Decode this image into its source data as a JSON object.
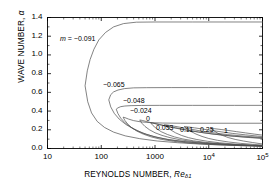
{
  "figure": {
    "background": "#ffffff",
    "axis_color": "#000000",
    "curve_color": "#4d4d4d"
  },
  "axes": {
    "y_title_main": "WAVE NUMBER,",
    "y_title_symbol": "α",
    "x_title_main": "REYNOLDS NUMBER,",
    "x_title_symbol": "Re",
    "x_title_subscript": "δ1",
    "y_ticks": [
      "0.0",
      "0.2",
      "0.4",
      "0.6",
      "0.8",
      "1.0",
      "1.2",
      "1.4"
    ],
    "x_ticks": [
      {
        "label": "10",
        "sup": ""
      },
      {
        "label": "100",
        "sup": ""
      },
      {
        "label": "1000",
        "sup": ""
      },
      {
        "label": "10",
        "sup": "4"
      },
      {
        "label": "10",
        "sup": "5"
      }
    ]
  },
  "contour_labels": [
    {
      "id": "m-label",
      "text": "m = −0.091",
      "x": 60,
      "y": 35,
      "italic_prefix": true
    },
    {
      "id": "label-m0065",
      "text": "−0.065",
      "x": 103,
      "y": 81,
      "italic_prefix": false
    },
    {
      "id": "label-m0048",
      "text": "−0.048",
      "x": 123,
      "y": 97,
      "italic_prefix": false
    },
    {
      "id": "label-m0024",
      "text": "−0.024",
      "x": 130,
      "y": 107,
      "italic_prefix": false
    },
    {
      "id": "label-0",
      "text": "0",
      "x": 146,
      "y": 115,
      "italic_prefix": false
    },
    {
      "id": "label-0053",
      "text": "0.053",
      "x": 156,
      "y": 124,
      "italic_prefix": false
    },
    {
      "id": "label-011",
      "text": "0.11",
      "x": 180,
      "y": 126,
      "italic_prefix": false
    },
    {
      "id": "label-025",
      "text": "0.25",
      "x": 200,
      "y": 126,
      "italic_prefix": false
    },
    {
      "id": "label-1",
      "text": "1",
      "x": 224,
      "y": 127,
      "italic_prefix": false
    }
  ],
  "chart_data": {
    "type": "line",
    "title": "",
    "xlabel": "REYNOLDS NUMBER, Re_δ1",
    "ylabel": "WAVE NUMBER, α",
    "xscale": "log",
    "yscale": "linear",
    "xlim": [
      10,
      100000
    ],
    "ylim": [
      0.0,
      1.4
    ],
    "xticks": [
      10,
      100,
      1000,
      10000,
      100000
    ],
    "yticks": [
      0.0,
      0.2,
      0.4,
      0.6,
      0.8,
      1.0,
      1.2,
      1.4
    ],
    "grid": false,
    "legend": "inline-contour-labels",
    "series": [
      {
        "name": "m = -0.091",
        "m": -0.091,
        "nose": {
          "Re": 50,
          "alpha": 0.67
        },
        "upper_asymptote": 1.35,
        "upper_branch": [
          [
            50,
            0.67
          ],
          [
            55,
            0.83
          ],
          [
            62,
            0.95
          ],
          [
            73,
            1.06
          ],
          [
            90,
            1.16
          ],
          [
            120,
            1.24
          ],
          [
            170,
            1.3
          ],
          [
            260,
            1.335
          ],
          [
            450,
            1.35
          ],
          [
            1000,
            1.352
          ],
          [
            5000,
            1.352
          ],
          [
            20000,
            1.352
          ],
          [
            100000,
            1.352
          ]
        ],
        "lower_branch": [
          [
            50,
            0.67
          ],
          [
            56,
            0.5
          ],
          [
            66,
            0.38
          ],
          [
            84,
            0.29
          ],
          [
            115,
            0.225
          ],
          [
            170,
            0.175
          ],
          [
            280,
            0.135
          ],
          [
            520,
            0.105
          ],
          [
            1100,
            0.08
          ],
          [
            2600,
            0.062
          ],
          [
            7000,
            0.047
          ],
          [
            20000,
            0.036
          ],
          [
            60000,
            0.028
          ],
          [
            100000,
            0.025
          ]
        ]
      },
      {
        "name": "m = -0.065",
        "m": -0.065,
        "nose": {
          "Re": 138,
          "alpha": 0.52
        },
        "upper_asymptote": 0.65,
        "upper_branch": [
          [
            138,
            0.52
          ],
          [
            150,
            0.575
          ],
          [
            170,
            0.605
          ],
          [
            205,
            0.625
          ],
          [
            270,
            0.64
          ],
          [
            400,
            0.648
          ],
          [
            700,
            0.65
          ],
          [
            2000,
            0.651
          ],
          [
            10000,
            0.651
          ],
          [
            100000,
            0.651
          ]
        ],
        "lower_branch": [
          [
            138,
            0.52
          ],
          [
            150,
            0.445
          ],
          [
            175,
            0.375
          ],
          [
            215,
            0.315
          ],
          [
            285,
            0.258
          ],
          [
            400,
            0.208
          ],
          [
            600,
            0.163
          ],
          [
            950,
            0.128
          ],
          [
            1700,
            0.098
          ],
          [
            3400,
            0.075
          ],
          [
            8000,
            0.056
          ],
          [
            22000,
            0.042
          ],
          [
            60000,
            0.033
          ],
          [
            100000,
            0.029
          ]
        ]
      },
      {
        "name": "m = -0.048",
        "m": -0.048,
        "nose": {
          "Re": 190,
          "alpha": 0.42
        },
        "upper_asymptote": 0.46,
        "upper_branch": [
          [
            190,
            0.42
          ],
          [
            205,
            0.435
          ],
          [
            230,
            0.447
          ],
          [
            275,
            0.454
          ],
          [
            360,
            0.458
          ],
          [
            560,
            0.46
          ],
          [
            1200,
            0.461
          ],
          [
            5000,
            0.461
          ],
          [
            30000,
            0.461
          ],
          [
            100000,
            0.461
          ]
        ],
        "lower_branch": [
          [
            190,
            0.42
          ],
          [
            205,
            0.372
          ],
          [
            230,
            0.325
          ],
          [
            275,
            0.276
          ],
          [
            350,
            0.23
          ],
          [
            480,
            0.188
          ],
          [
            700,
            0.15
          ],
          [
            1100,
            0.118
          ],
          [
            1900,
            0.091
          ],
          [
            3700,
            0.07
          ],
          [
            8500,
            0.053
          ],
          [
            24000,
            0.04
          ],
          [
            65000,
            0.031
          ],
          [
            100000,
            0.028
          ]
        ]
      },
      {
        "name": "m = -0.024",
        "m": -0.024,
        "nose": {
          "Re": 255,
          "alpha": 0.335
        },
        "upper_asymptote": 0.27,
        "upper_branch": [
          [
            255,
            0.335
          ],
          [
            275,
            0.33
          ],
          [
            320,
            0.315
          ],
          [
            400,
            0.298
          ],
          [
            540,
            0.285
          ],
          [
            800,
            0.277
          ],
          [
            1400,
            0.272
          ],
          [
            3000,
            0.27
          ],
          [
            12000,
            0.27
          ],
          [
            100000,
            0.27
          ]
        ],
        "lower_branch": [
          [
            255,
            0.335
          ],
          [
            275,
            0.3
          ],
          [
            310,
            0.262
          ],
          [
            370,
            0.222
          ],
          [
            460,
            0.186
          ],
          [
            610,
            0.153
          ],
          [
            850,
            0.124
          ],
          [
            1300,
            0.098
          ],
          [
            2200,
            0.077
          ],
          [
            4200,
            0.059
          ],
          [
            9500,
            0.045
          ],
          [
            26000,
            0.034
          ],
          [
            70000,
            0.026
          ],
          [
            100000,
            0.023
          ]
        ]
      },
      {
        "name": "m = 0",
        "m": 0,
        "nose": {
          "Re": 520,
          "alpha": 0.305
        },
        "upper_asymptote": 0.17,
        "upper_branch": [
          [
            520,
            0.305
          ],
          [
            580,
            0.3
          ],
          [
            700,
            0.288
          ],
          [
            900,
            0.272
          ],
          [
            1300,
            0.25
          ],
          [
            2000,
            0.226
          ],
          [
            3500,
            0.2
          ],
          [
            6500,
            0.175
          ],
          [
            13000,
            0.152
          ],
          [
            30000,
            0.13
          ],
          [
            60000,
            0.116
          ],
          [
            100000,
            0.108
          ]
        ],
        "lower_branch": [
          [
            520,
            0.305
          ],
          [
            570,
            0.27
          ],
          [
            650,
            0.236
          ],
          [
            790,
            0.2
          ],
          [
            1000,
            0.168
          ],
          [
            1350,
            0.14
          ],
          [
            1900,
            0.116
          ],
          [
            2900,
            0.094
          ],
          [
            4800,
            0.075
          ],
          [
            9000,
            0.059
          ],
          [
            20000,
            0.045
          ],
          [
            45000,
            0.035
          ],
          [
            100000,
            0.027
          ]
        ]
      },
      {
        "name": "0.053",
        "m": 0.053,
        "nose": {
          "Re": 830,
          "alpha": 0.275
        },
        "upper_asymptote": 0.155,
        "upper_branch": [
          [
            830,
            0.275
          ],
          [
            950,
            0.27
          ],
          [
            1200,
            0.258
          ],
          [
            1600,
            0.242
          ],
          [
            2400,
            0.222
          ],
          [
            3800,
            0.199
          ],
          [
            6500,
            0.176
          ],
          [
            12000,
            0.154
          ],
          [
            25000,
            0.135
          ],
          [
            55000,
            0.12
          ],
          [
            100000,
            0.111
          ]
        ],
        "lower_branch": [
          [
            830,
            0.275
          ],
          [
            920,
            0.244
          ],
          [
            1070,
            0.212
          ],
          [
            1300,
            0.18
          ],
          [
            1700,
            0.15
          ],
          [
            2300,
            0.124
          ],
          [
            3300,
            0.102
          ],
          [
            5200,
            0.082
          ],
          [
            8800,
            0.065
          ],
          [
            17000,
            0.051
          ],
          [
            38000,
            0.039
          ],
          [
            100000,
            0.028
          ]
        ]
      },
      {
        "name": "0.11",
        "m": 0.11,
        "nose": {
          "Re": 1500,
          "alpha": 0.255
        },
        "upper_asymptote": 0.145,
        "upper_branch": [
          [
            1500,
            0.255
          ],
          [
            1750,
            0.25
          ],
          [
            2200,
            0.24
          ],
          [
            3000,
            0.226
          ],
          [
            4500,
            0.208
          ],
          [
            7000,
            0.188
          ],
          [
            12000,
            0.168
          ],
          [
            22000,
            0.149
          ],
          [
            45000,
            0.132
          ],
          [
            100000,
            0.117
          ]
        ],
        "lower_branch": [
          [
            1500,
            0.255
          ],
          [
            1700,
            0.226
          ],
          [
            1980,
            0.197
          ],
          [
            2400,
            0.168
          ],
          [
            3100,
            0.14
          ],
          [
            4200,
            0.116
          ],
          [
            6000,
            0.096
          ],
          [
            9500,
            0.077
          ],
          [
            16000,
            0.061
          ],
          [
            31000,
            0.047
          ],
          [
            65000,
            0.036
          ],
          [
            100000,
            0.031
          ]
        ]
      },
      {
        "name": "0.25",
        "m": 0.25,
        "nose": {
          "Re": 3500,
          "alpha": 0.235
        },
        "upper_asymptote": 0.138,
        "upper_branch": [
          [
            3500,
            0.235
          ],
          [
            4200,
            0.23
          ],
          [
            5400,
            0.221
          ],
          [
            7500,
            0.209
          ],
          [
            11000,
            0.194
          ],
          [
            17000,
            0.178
          ],
          [
            28000,
            0.161
          ],
          [
            48000,
            0.146
          ],
          [
            80000,
            0.133
          ],
          [
            100000,
            0.128
          ]
        ],
        "lower_branch": [
          [
            3500,
            0.235
          ],
          [
            4000,
            0.208
          ],
          [
            4700,
            0.181
          ],
          [
            5800,
            0.154
          ],
          [
            7500,
            0.129
          ],
          [
            10000,
            0.107
          ],
          [
            14500,
            0.088
          ],
          [
            23000,
            0.07
          ],
          [
            39000,
            0.055
          ],
          [
            70000,
            0.043
          ],
          [
            100000,
            0.037
          ]
        ]
      },
      {
        "name": "1",
        "m": 1.0,
        "nose": {
          "Re": 11000,
          "alpha": 0.215
        },
        "upper_asymptote": 0.132,
        "upper_branch": [
          [
            11000,
            0.215
          ],
          [
            13000,
            0.211
          ],
          [
            17000,
            0.203
          ],
          [
            23000,
            0.193
          ],
          [
            33000,
            0.18
          ],
          [
            48000,
            0.167
          ],
          [
            70000,
            0.154
          ],
          [
            100000,
            0.143
          ]
        ],
        "lower_branch": [
          [
            11000,
            0.215
          ],
          [
            12500,
            0.19
          ],
          [
            14500,
            0.165
          ],
          [
            18000,
            0.14
          ],
          [
            23000,
            0.117
          ],
          [
            31000,
            0.097
          ],
          [
            44000,
            0.08
          ],
          [
            65000,
            0.064
          ],
          [
            100000,
            0.048
          ]
        ]
      }
    ]
  }
}
